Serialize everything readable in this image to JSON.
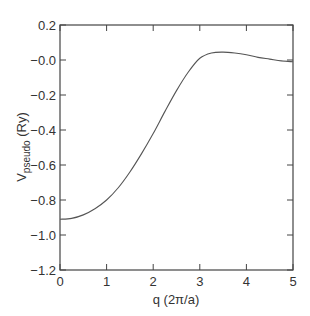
{
  "chart_data": {
    "type": "line",
    "title": "",
    "xlabel": "q (2π/a)",
    "ylabel": "V_pseudo (Ry)",
    "ylabel_main": "V",
    "ylabel_sub": "pseudo",
    "ylabel_unit": " (Ry)",
    "xlim": [
      0,
      5
    ],
    "ylim": [
      -1.2,
      0.2
    ],
    "xticks": [
      "0",
      "1",
      "2",
      "3",
      "4",
      "5"
    ],
    "yticks": [
      "0.2",
      "-0.0",
      "-0.2",
      "-0.4",
      "-0.6",
      "-0.8",
      "-1.0",
      "-1.2"
    ],
    "grid": false,
    "legend": null,
    "series": [
      {
        "name": "V_pseudo",
        "color": "#555555",
        "x": [
          0,
          0.25,
          0.5,
          0.75,
          1.0,
          1.25,
          1.5,
          1.75,
          2.0,
          2.25,
          2.5,
          2.75,
          3.0,
          3.25,
          3.5,
          3.75,
          4.0,
          4.25,
          4.5,
          4.75,
          5.0
        ],
        "y": [
          -0.91,
          -0.905,
          -0.885,
          -0.85,
          -0.8,
          -0.73,
          -0.64,
          -0.535,
          -0.42,
          -0.295,
          -0.175,
          -0.07,
          0.01,
          0.04,
          0.045,
          0.04,
          0.03,
          0.015,
          0.005,
          -0.005,
          -0.01
        ]
      }
    ]
  }
}
